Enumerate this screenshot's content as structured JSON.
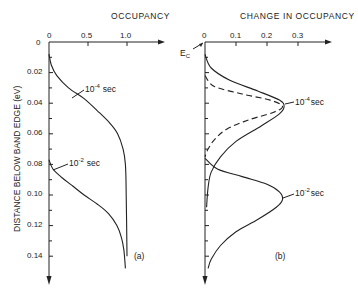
{
  "chart_data": [
    {
      "type": "line",
      "panel_label": "(a)",
      "title": "OCCUPANCY",
      "xlabel": "OCCUPANCY",
      "ylabel": "DISTANCE BELOW BAND EDGE (eV)",
      "x_ticks": [
        "0",
        "0.5",
        "1.0"
      ],
      "y_ticks": [
        "0",
        "0.02",
        "0.04",
        "0.06",
        "0.08",
        "0.10",
        "0.12",
        "0.14"
      ],
      "xlim": [
        0,
        1.2
      ],
      "ylim": [
        0,
        0.15
      ],
      "y_inverted": true,
      "series": [
        {
          "name": "10^-4 sec",
          "style": "solid",
          "points": [
            [
              0.0,
              0.008
            ],
            [
              0.03,
              0.015
            ],
            [
              0.1,
              0.022
            ],
            [
              0.25,
              0.03
            ],
            [
              0.45,
              0.037
            ],
            [
              0.62,
              0.045
            ],
            [
              0.78,
              0.053
            ],
            [
              0.88,
              0.06
            ],
            [
              0.95,
              0.07
            ],
            [
              0.98,
              0.08
            ],
            [
              0.99,
              0.1
            ],
            [
              1.0,
              0.14
            ]
          ]
        },
        {
          "name": "10^-2 sec",
          "style": "solid",
          "points": [
            [
              0.0,
              0.077
            ],
            [
              0.05,
              0.083
            ],
            [
              0.15,
              0.088
            ],
            [
              0.3,
              0.094
            ],
            [
              0.45,
              0.1
            ],
            [
              0.62,
              0.106
            ],
            [
              0.76,
              0.112
            ],
            [
              0.87,
              0.12
            ],
            [
              0.93,
              0.128
            ],
            [
              0.96,
              0.136
            ],
            [
              0.98,
              0.148
            ]
          ]
        }
      ],
      "annotations": [
        "10^-4 sec",
        "10^-2 sec",
        "(a)"
      ]
    },
    {
      "type": "line",
      "panel_label": "(b)",
      "title": "CHANGE IN OCCUPANCY",
      "xlabel": "CHANGE IN OCCUPANCY",
      "ylabel": "DISTANCE BELOW BAND EDGE (eV)",
      "x_ticks": [
        "0",
        "0.1",
        "0.2",
        "0.3"
      ],
      "xlim": [
        0,
        0.38
      ],
      "ylim": [
        0,
        0.15
      ],
      "y_inverted": true,
      "series": [
        {
          "name": "10^-4 sec (solid)",
          "style": "solid",
          "points": [
            [
              0.0,
              0.008
            ],
            [
              0.02,
              0.017
            ],
            [
              0.08,
              0.025
            ],
            [
              0.17,
              0.032
            ],
            [
              0.24,
              0.038
            ],
            [
              0.255,
              0.042
            ],
            [
              0.24,
              0.047
            ],
            [
              0.18,
              0.055
            ],
            [
              0.1,
              0.065
            ],
            [
              0.05,
              0.075
            ],
            [
              0.02,
              0.085
            ],
            [
              0.01,
              0.095
            ],
            [
              0.005,
              0.108
            ]
          ]
        },
        {
          "name": "10^-4 sec (dashed)",
          "style": "dashed",
          "points": [
            [
              0.0,
              0.022
            ],
            [
              0.03,
              0.029
            ],
            [
              0.12,
              0.034
            ],
            [
              0.21,
              0.038
            ],
            [
              0.25,
              0.042
            ],
            [
              0.22,
              0.046
            ],
            [
              0.14,
              0.051
            ],
            [
              0.07,
              0.057
            ],
            [
              0.03,
              0.064
            ],
            [
              0.01,
              0.07
            ],
            [
              0.0,
              0.075
            ]
          ]
        },
        {
          "name": "10^-2 sec",
          "style": "solid",
          "points": [
            [
              0.0,
              0.076
            ],
            [
              0.04,
              0.083
            ],
            [
              0.12,
              0.088
            ],
            [
              0.2,
              0.093
            ],
            [
              0.24,
              0.098
            ],
            [
              0.25,
              0.103
            ],
            [
              0.23,
              0.108
            ],
            [
              0.17,
              0.116
            ],
            [
              0.1,
              0.124
            ],
            [
              0.05,
              0.133
            ],
            [
              0.02,
              0.142
            ],
            [
              0.01,
              0.148
            ]
          ]
        }
      ],
      "annotations": [
        "E_C",
        "10^-4 sec",
        "10^-2 sec",
        "(b)"
      ]
    }
  ],
  "labels": {
    "title_a": "OCCUPANCY",
    "title_b": "CHANGE IN OCCUPANCY",
    "ylabel": "DISTANCE BELOW BAND EDGE (eV)",
    "panel_a": "(a)",
    "panel_b": "(b)",
    "ec": "E",
    "ec_sub": "C",
    "a_xticks": [
      "0",
      "0.5",
      "1.0"
    ],
    "b_xticks": [
      "0",
      "0.1",
      "0.2",
      "0.3"
    ],
    "yticks": [
      "0",
      "0.02",
      "0.04",
      "0.06",
      "0.08",
      "0.10",
      "0.12",
      "0.14"
    ],
    "ann_a_1e4": "10",
    "ann_a_1e4_exp": "-4",
    "ann_a_1e2": "10",
    "ann_a_1e2_exp": "-2",
    "ann_sec": "sec"
  }
}
